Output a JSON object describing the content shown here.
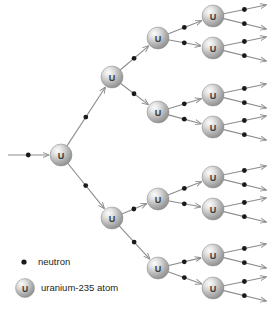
{
  "diagram": {
    "background_color": "#ffffff",
    "line_color": "#8c8c8c",
    "neutron_color": "#1a1a1a",
    "atom_fill_light": "#f2f2f2",
    "atom_fill_mid": "#b8b8b8",
    "atom_fill_dark": "#8f8f8f",
    "atom_label": "U",
    "atom_radius": 11,
    "neutron_radius": 2.4,
    "generations": 4,
    "atoms": [
      {
        "id": "gen1-a",
        "label": "U",
        "x": 61,
        "y": 155
      },
      {
        "id": "gen2-a",
        "label": "U",
        "x": 112,
        "y": 77
      },
      {
        "id": "gen2-b",
        "label": "U",
        "x": 112,
        "y": 218
      },
      {
        "id": "gen3-a",
        "label": "U",
        "x": 158,
        "y": 38
      },
      {
        "id": "gen3-b",
        "label": "U",
        "x": 158,
        "y": 112
      },
      {
        "id": "gen3-c",
        "label": "U",
        "x": 158,
        "y": 199
      },
      {
        "id": "gen3-d",
        "label": "U",
        "x": 158,
        "y": 268
      },
      {
        "id": "gen4-a",
        "label": "U",
        "x": 213,
        "y": 16
      },
      {
        "id": "gen4-b",
        "label": "U",
        "x": 213,
        "y": 48
      },
      {
        "id": "gen4-c",
        "label": "U",
        "x": 213,
        "y": 95
      },
      {
        "id": "gen4-d",
        "label": "U",
        "x": 213,
        "y": 127
      },
      {
        "id": "gen4-e",
        "label": "U",
        "x": 213,
        "y": 177
      },
      {
        "id": "gen4-f",
        "label": "U",
        "x": 213,
        "y": 209
      },
      {
        "id": "gen4-g",
        "label": "U",
        "x": 213,
        "y": 255
      },
      {
        "id": "gen4-h",
        "label": "U",
        "x": 213,
        "y": 288
      }
    ],
    "paths": [
      {
        "id": "incoming",
        "x1": 8,
        "y1": 155,
        "x2": 61,
        "y2": 155,
        "arrow": true
      },
      {
        "id": "g1-to-g2a",
        "x1": 61,
        "y1": 155,
        "x2": 112,
        "y2": 77,
        "arrow": true
      },
      {
        "id": "g1-to-g2b",
        "x1": 61,
        "y1": 155,
        "x2": 112,
        "y2": 218,
        "arrow": true
      },
      {
        "id": "g2a-to-g3a",
        "x1": 112,
        "y1": 77,
        "x2": 158,
        "y2": 38,
        "arrow": true
      },
      {
        "id": "g2a-to-g3b",
        "x1": 112,
        "y1": 77,
        "x2": 158,
        "y2": 112,
        "arrow": true
      },
      {
        "id": "g2b-to-g3c",
        "x1": 112,
        "y1": 218,
        "x2": 158,
        "y2": 199,
        "arrow": true
      },
      {
        "id": "g2b-to-g3d",
        "x1": 112,
        "y1": 218,
        "x2": 158,
        "y2": 268,
        "arrow": true
      },
      {
        "id": "g3a-to-g4a",
        "x1": 158,
        "y1": 38,
        "x2": 213,
        "y2": 16,
        "arrow": true
      },
      {
        "id": "g3a-to-g4b",
        "x1": 158,
        "y1": 38,
        "x2": 213,
        "y2": 48,
        "arrow": true
      },
      {
        "id": "g3b-to-g4c",
        "x1": 158,
        "y1": 112,
        "x2": 213,
        "y2": 95,
        "arrow": true
      },
      {
        "id": "g3b-to-g4d",
        "x1": 158,
        "y1": 112,
        "x2": 213,
        "y2": 127,
        "arrow": true
      },
      {
        "id": "g3c-to-g4e",
        "x1": 158,
        "y1": 199,
        "x2": 213,
        "y2": 177,
        "arrow": true
      },
      {
        "id": "g3c-to-g4f",
        "x1": 158,
        "y1": 199,
        "x2": 213,
        "y2": 209,
        "arrow": true
      },
      {
        "id": "g3d-to-g4g",
        "x1": 158,
        "y1": 268,
        "x2": 213,
        "y2": 255,
        "arrow": true
      },
      {
        "id": "g3d-to-g4h",
        "x1": 158,
        "y1": 268,
        "x2": 213,
        "y2": 288,
        "arrow": true
      },
      {
        "id": "g4a-out-1",
        "x1": 213,
        "y1": 16,
        "x2": 266,
        "y2": 5,
        "arrow": true
      },
      {
        "id": "g4a-out-2",
        "x1": 213,
        "y1": 16,
        "x2": 266,
        "y2": 29,
        "arrow": true
      },
      {
        "id": "g4b-out-1",
        "x1": 213,
        "y1": 48,
        "x2": 266,
        "y2": 37,
        "arrow": true
      },
      {
        "id": "g4b-out-2",
        "x1": 213,
        "y1": 48,
        "x2": 266,
        "y2": 61,
        "arrow": true
      },
      {
        "id": "g4c-out-1",
        "x1": 213,
        "y1": 95,
        "x2": 266,
        "y2": 84,
        "arrow": true
      },
      {
        "id": "g4c-out-2",
        "x1": 213,
        "y1": 95,
        "x2": 266,
        "y2": 108,
        "arrow": true
      },
      {
        "id": "g4d-out-1",
        "x1": 213,
        "y1": 127,
        "x2": 266,
        "y2": 116,
        "arrow": true
      },
      {
        "id": "g4d-out-2",
        "x1": 213,
        "y1": 127,
        "x2": 266,
        "y2": 140,
        "arrow": true
      },
      {
        "id": "g4e-out-1",
        "x1": 213,
        "y1": 177,
        "x2": 266,
        "y2": 166,
        "arrow": true
      },
      {
        "id": "g4e-out-2",
        "x1": 213,
        "y1": 177,
        "x2": 266,
        "y2": 190,
        "arrow": true
      },
      {
        "id": "g4f-out-1",
        "x1": 213,
        "y1": 209,
        "x2": 266,
        "y2": 198,
        "arrow": true
      },
      {
        "id": "g4f-out-2",
        "x1": 213,
        "y1": 209,
        "x2": 266,
        "y2": 222,
        "arrow": true
      },
      {
        "id": "g4g-out-1",
        "x1": 213,
        "y1": 255,
        "x2": 266,
        "y2": 244,
        "arrow": true
      },
      {
        "id": "g4g-out-2",
        "x1": 213,
        "y1": 255,
        "x2": 266,
        "y2": 268,
        "arrow": true
      },
      {
        "id": "g4h-out-1",
        "x1": 213,
        "y1": 288,
        "x2": 266,
        "y2": 277,
        "arrow": true
      },
      {
        "id": "g4h-out-2",
        "x1": 213,
        "y1": 288,
        "x2": 266,
        "y2": 301,
        "arrow": true
      }
    ]
  },
  "legend": {
    "neutron": {
      "label": "neutron",
      "symbol_x": 24,
      "symbol_y": 262,
      "text_x": 38,
      "text_y": 265
    },
    "atom": {
      "label": "uranium-235 atom",
      "symbol_label": "U",
      "symbol_x": 25,
      "symbol_y": 288,
      "text_x": 41,
      "text_y": 291
    }
  }
}
